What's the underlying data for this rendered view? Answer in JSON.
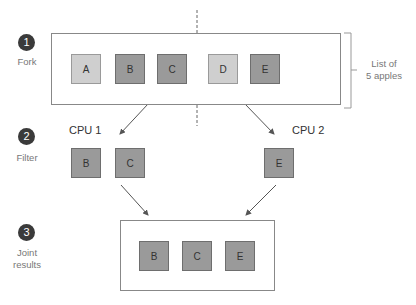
{
  "steps": [
    {
      "number": "1",
      "label": "Fork"
    },
    {
      "number": "2",
      "label": "Filter"
    },
    {
      "number": "3",
      "label_line1": "Joint",
      "label_line2": "results"
    }
  ],
  "fork": {
    "apples": [
      {
        "name": "A",
        "shade": "light"
      },
      {
        "name": "B",
        "shade": "dark"
      },
      {
        "name": "C",
        "shade": "dark"
      },
      {
        "name": "D",
        "shade": "light"
      },
      {
        "name": "E",
        "shade": "dark"
      }
    ],
    "brace_label_line1": "List of",
    "brace_label_line2": "5 apples"
  },
  "filter": {
    "cpu1": {
      "label": "CPU 1",
      "apples": [
        "B",
        "C"
      ]
    },
    "cpu2": {
      "label": "CPU 2",
      "apples": [
        "E"
      ]
    }
  },
  "joint": {
    "apples": [
      "B",
      "C",
      "E"
    ]
  },
  "colors": {
    "dark_apple": "#9a9a9a",
    "light_apple": "#cfcfcf",
    "badge": "#3a3a3a",
    "line": "#888888"
  }
}
